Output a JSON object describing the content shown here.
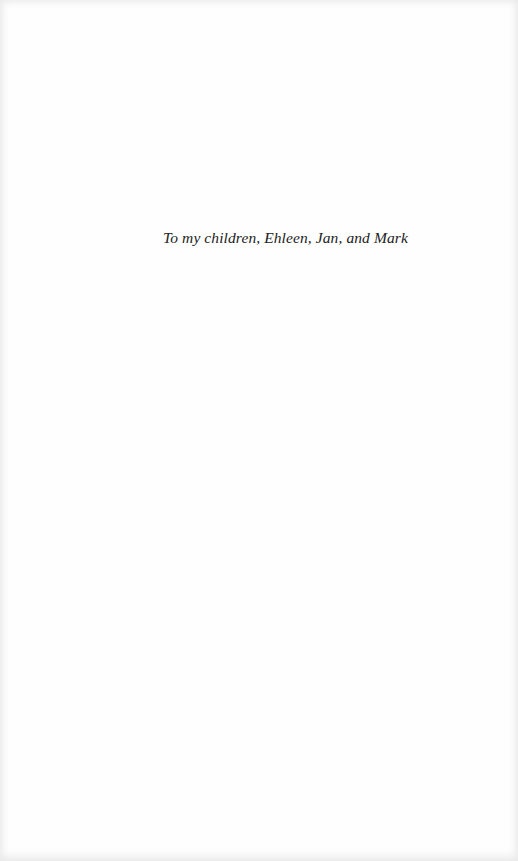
{
  "page": {
    "type": "dedication",
    "dedication_text": "To my children, Ehleen, Jan, and Mark"
  },
  "colors": {
    "background": "#fefefe",
    "text": "#222222"
  }
}
